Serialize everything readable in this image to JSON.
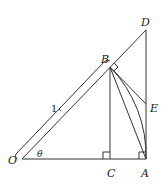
{
  "diagram": {
    "type": "geometry",
    "points": {
      "O": {
        "label": "O"
      },
      "A": {
        "label": "A"
      },
      "B": {
        "label": "B"
      },
      "C": {
        "label": "C"
      },
      "D": {
        "label": "D"
      },
      "E": {
        "label": "E"
      }
    },
    "angle_label": "θ",
    "length_label": "1",
    "segments": [
      "OA",
      "OD",
      "BC",
      "AD",
      "BA",
      "BE"
    ],
    "arc": "BA (arc centered at O)",
    "right_angles": [
      "BCO",
      "OAD",
      "OBE"
    ],
    "stroke_color": "#333333"
  }
}
